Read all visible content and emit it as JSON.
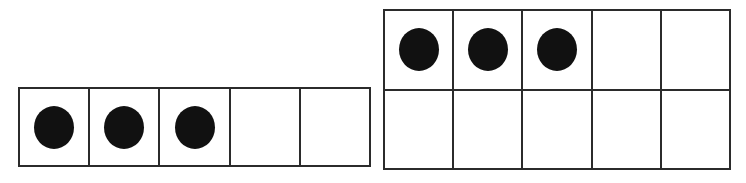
{
  "page": {
    "background_color": "#ffffff",
    "width": 746,
    "height": 183
  },
  "style": {
    "border_color": "#2b2b2b",
    "counter_color": "#111111",
    "cell_fill": "#ffffff"
  },
  "frames": [
    {
      "name": "five-frame-left",
      "rows": 1,
      "columns": 5,
      "total_cells": 5,
      "filled_count": 3,
      "empty_count": 2,
      "cells": [
        [
          {
            "filled": true,
            "counter": "black-circle"
          },
          {
            "filled": true,
            "counter": "black-circle"
          },
          {
            "filled": true,
            "counter": "black-circle"
          },
          {
            "filled": false,
            "counter": null
          },
          {
            "filled": false,
            "counter": null
          }
        ]
      ]
    },
    {
      "name": "ten-frame-right",
      "rows": 2,
      "columns": 5,
      "total_cells": 10,
      "filled_count": 3,
      "empty_count": 7,
      "cells": [
        [
          {
            "filled": true,
            "counter": "black-circle"
          },
          {
            "filled": true,
            "counter": "black-circle"
          },
          {
            "filled": true,
            "counter": "black-circle"
          },
          {
            "filled": false,
            "counter": null
          },
          {
            "filled": false,
            "counter": null
          }
        ],
        [
          {
            "filled": false,
            "counter": null
          },
          {
            "filled": false,
            "counter": null
          },
          {
            "filled": false,
            "counter": null
          },
          {
            "filled": false,
            "counter": null
          },
          {
            "filled": false,
            "counter": null
          }
        ]
      ]
    }
  ]
}
